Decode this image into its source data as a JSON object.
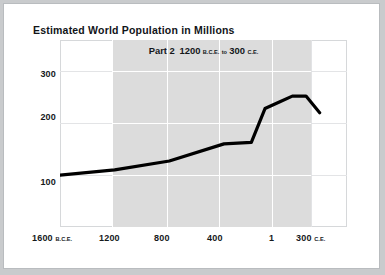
{
  "page": {
    "title": "Estimated World Population in Millions",
    "background_color": "#ffffff",
    "outer_color": "#c9cbcd"
  },
  "subtitle": {
    "part_label": "Part 2",
    "range_start": "1200",
    "range_start_era": "B.C.E.",
    "connector": "to",
    "range_end": "300",
    "range_end_era": "C.E."
  },
  "axes": {
    "y_ticks": [
      "300",
      "200",
      "100"
    ],
    "x_ticks": [
      {
        "label": "1600",
        "era": "B.C.E."
      },
      {
        "label": "1200",
        "era": ""
      },
      {
        "label": "800",
        "era": ""
      },
      {
        "label": "400",
        "era": ""
      },
      {
        "label": "1",
        "era": ""
      },
      {
        "label": "300",
        "era": "C.E."
      }
    ]
  },
  "colors": {
    "line": "#000000",
    "highlight_band": "#dcdcdc",
    "grid": "#e3e4e6",
    "text": "#15181b"
  },
  "chart_data": {
    "type": "line",
    "title": "Estimated World Population in Millions",
    "subtitle": "Part 2  1200 B.C.E. to 300 C.E.",
    "xlabel": "",
    "ylabel": "Millions",
    "xlim": [
      -1600,
      500
    ],
    "ylim": [
      0,
      360
    ],
    "ytick_values": [
      300,
      200,
      100
    ],
    "xtick_values": [
      -1600,
      -1200,
      -800,
      -400,
      1,
      300
    ],
    "grid": true,
    "legend": "none",
    "highlight_range": [
      -1200,
      300
    ],
    "series": [
      {
        "name": "Estimated world population",
        "x": [
          -1600,
          -1200,
          -800,
          -400,
          -200,
          -100,
          1,
          100,
          200,
          300
        ],
        "values": [
          100,
          110,
          127,
          160,
          163,
          228,
          240,
          252,
          252,
          220
        ]
      }
    ]
  }
}
